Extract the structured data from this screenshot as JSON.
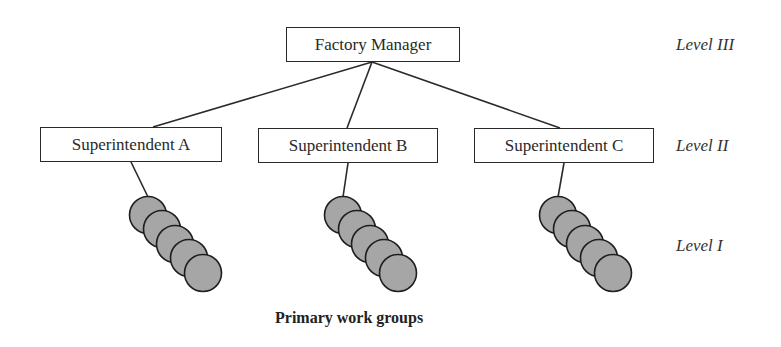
{
  "diagram": {
    "type": "organizational-hierarchy",
    "top": {
      "label": "Factory Manager"
    },
    "middle": [
      {
        "label": "Superintendent A"
      },
      {
        "label": "Superintendent B"
      },
      {
        "label": "Superintendent C"
      }
    ],
    "group_size": 5,
    "levels": {
      "level3": "Level III",
      "level2": "Level II",
      "level1": "Level I"
    },
    "caption": "Primary work groups",
    "colors": {
      "line": "#2a2a2a",
      "circle_fill": "#a6a6a6",
      "circle_stroke": "#1e1e1e"
    }
  }
}
